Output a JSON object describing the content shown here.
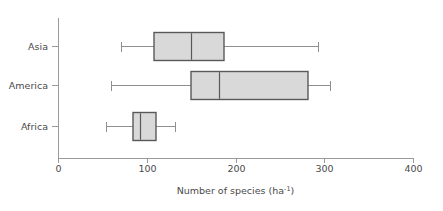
{
  "chart_data": {
    "type": "box",
    "title": "",
    "xlabel": "Number of species (ha",
    "xlabel_sup": "-1",
    "xlabel_suffix": ")",
    "ylabel": "",
    "orientation": "horizontal",
    "xlim": [
      0,
      400
    ],
    "xticks": [
      0,
      100,
      200,
      300,
      400
    ],
    "xtick_labels": [
      "0",
      "100",
      "200",
      "300",
      "400"
    ],
    "grid": false,
    "legend": "none",
    "categories": [
      "Asia",
      "America",
      "Africa"
    ],
    "boxes": [
      {
        "category": "Asia",
        "whisker_low": 71,
        "q1": 108,
        "median": 150,
        "q3": 187,
        "whisker_high": 293
      },
      {
        "category": "America",
        "whisker_low": 60,
        "q1": 150,
        "median": 181,
        "q3": 282,
        "whisker_high": 306
      },
      {
        "category": "Africa",
        "whisker_low": 54,
        "q1": 85,
        "median": 92,
        "q3": 110,
        "whisker_high": 132
      }
    ],
    "colors": {
      "box_fill": "#d9d9d9",
      "box_stroke": "#595959",
      "whisker": "#8f8f8f",
      "axis": "#9a9a9a",
      "text": "#4a4a4a",
      "background": "#ffffff"
    }
  },
  "layout": {
    "plot_left_px": 58,
    "plot_right_px": 413,
    "axis_y_px": 158,
    "axis_top_px": 18,
    "row_y_px": [
      46,
      85,
      126
    ],
    "box_half_height_px": 14,
    "tick_len_px": 5,
    "cat_tick_len_px": 6,
    "whisker_cap_half_px": 5,
    "axis_title_y_px": 194,
    "tick_label_y_px": 172
  }
}
